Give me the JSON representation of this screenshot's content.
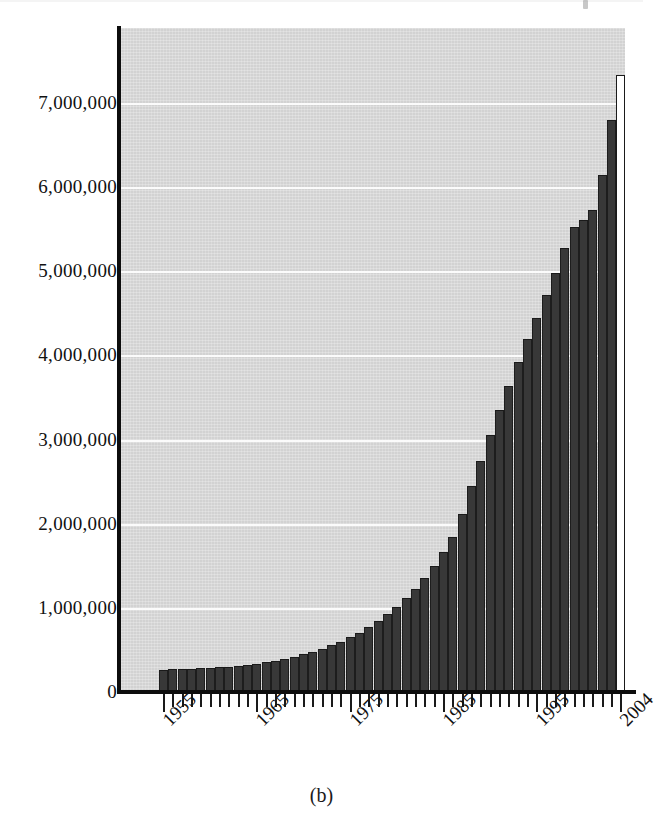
{
  "figure": {
    "caption": "(b)",
    "background_color": "#ffffff",
    "plot_background_color": "#d2d2d2",
    "bar_color": "#383838",
    "highlight_bar_color": "#ffffff",
    "gridline_color": "#fbfbfb",
    "axis_color": "#0d0d0d"
  },
  "chart_data": {
    "type": "bar",
    "title": "",
    "subtitle": "",
    "xlabel": "",
    "ylabel": "",
    "ylim": [
      0,
      7800000
    ],
    "xlim": [
      1954.5,
      2004.5
    ],
    "grid": true,
    "legend": null,
    "annotations": [
      "Final bar (2004) drawn as hollow/outlined bar rather than filled"
    ],
    "ytick_labels": [
      "0",
      "1,000,000",
      "2,000,000",
      "3,000,000",
      "4,000,000",
      "5,000,000",
      "6,000,000",
      "7,000,000"
    ],
    "ytick_values": [
      0,
      1000000,
      2000000,
      3000000,
      4000000,
      5000000,
      6000000,
      7000000
    ],
    "xtick_labels": [
      "1955",
      "1965",
      "1975",
      "1985",
      "1995",
      "2004"
    ],
    "xtick_values": [
      1955,
      1965,
      1975,
      1985,
      1995,
      2004
    ],
    "categories": [
      1955,
      1956,
      1957,
      1958,
      1959,
      1960,
      1961,
      1962,
      1963,
      1964,
      1965,
      1966,
      1967,
      1968,
      1969,
      1970,
      1971,
      1972,
      1973,
      1974,
      1975,
      1976,
      1977,
      1978,
      1979,
      1980,
      1981,
      1982,
      1983,
      1984,
      1985,
      1986,
      1987,
      1988,
      1989,
      1990,
      1991,
      1992,
      1993,
      1994,
      1995,
      1996,
      1997,
      1998,
      1999,
      2000,
      2001,
      2002,
      2003,
      2004
    ],
    "values": [
      265000,
      268000,
      272000,
      276000,
      281000,
      287000,
      294000,
      302000,
      312000,
      324000,
      338000,
      355000,
      374000,
      396000,
      420000,
      448000,
      480000,
      516000,
      556000,
      600000,
      650000,
      706000,
      770000,
      842000,
      922000,
      1012000,
      1114000,
      1228000,
      1356000,
      1500000,
      1662000,
      1848000,
      2110000,
      2450000,
      2750000,
      3050000,
      3350000,
      3640000,
      3920000,
      4190000,
      4450000,
      4720000,
      4980000,
      5280000,
      5530000,
      5610000,
      5730000,
      6140000,
      6800000,
      7330000
    ],
    "highlight_index": 49
  }
}
